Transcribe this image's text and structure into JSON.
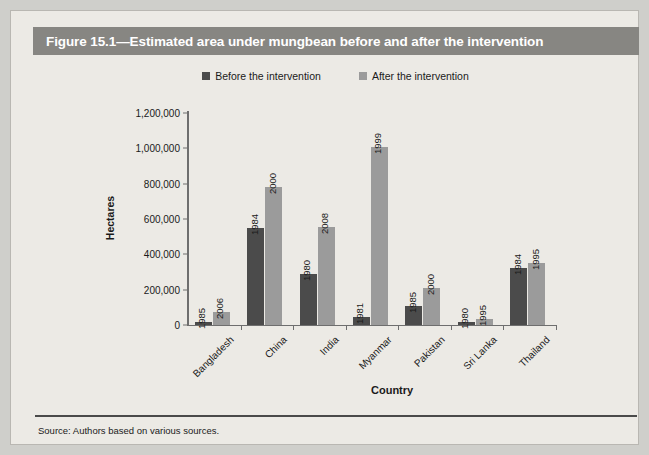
{
  "figure": {
    "title": "Figure 15.1—Estimated area under mungbean before and after the intervention",
    "source": "Source: Authors based on various sources."
  },
  "legend": {
    "position": "top-center",
    "items": [
      {
        "label": "Before the intervention",
        "color": "#4b4b4b",
        "icon": "square-swatch-dark"
      },
      {
        "label": "After the intervention",
        "color": "#9b9b9b",
        "icon": "square-swatch-light"
      }
    ]
  },
  "axes": {
    "ylabel": "Hectares",
    "xlabel": "Country",
    "yticks": [
      "0",
      "200,000",
      "400,000",
      "600,000",
      "800,000",
      "1,000,000",
      "1,200,000"
    ]
  },
  "chart_data": {
    "type": "bar",
    "title": "Figure 15.1—Estimated area under mungbean before and after the intervention",
    "subtitle": "",
    "xlabel": "Country",
    "ylabel": "Hectares",
    "ylim": [
      0,
      1200000
    ],
    "ytick_values": [
      0,
      200000,
      400000,
      600000,
      800000,
      1000000,
      1200000
    ],
    "ytick_labels": [
      "0",
      "200,000",
      "400,000",
      "600,000",
      "800,000",
      "1,000,000",
      "1,200,000"
    ],
    "grid": false,
    "legend_position": "top-center",
    "categories": [
      "Bangladesh",
      "China",
      "India",
      "Myanmar",
      "Pakistan",
      "Sri Lanka",
      "Thailand"
    ],
    "series": [
      {
        "name": "Before the intervention",
        "color": "#4b4b4b",
        "values": [
          15000,
          550000,
          290000,
          45000,
          110000,
          15000,
          325000
        ],
        "point_labels": [
          "1985",
          "1984",
          "1980",
          "1981",
          "1985",
          "1980",
          "1984"
        ]
      },
      {
        "name": "After the intervention",
        "color": "#9b9b9b",
        "values": [
          75000,
          780000,
          555000,
          1010000,
          210000,
          35000,
          350000
        ],
        "point_labels": [
          "2006",
          "2000",
          "2008",
          "1999",
          "2000",
          "1995",
          "1995"
        ]
      }
    ],
    "annotations": "Each bar is labeled with the year of its observation, rotated vertically above the bar."
  }
}
